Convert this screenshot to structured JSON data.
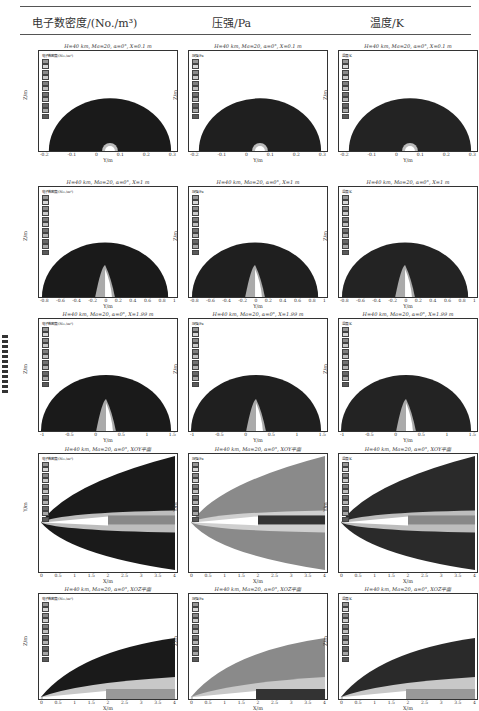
{
  "header": {
    "col1": "电子数密度/(No./m³)",
    "col2": "压强/Pa",
    "col3": "温度/K"
  },
  "rows": [
    {
      "section": "X=0.1 m",
      "titles": [
        "H=40 km, Ma=20, α=0°, X=0.1 m",
        "H=40 km, Ma=20, α=0°, X=0.1 m",
        "H=40 km, Ma=20, α=0°, X=0.1 m"
      ],
      "xlabel": "Y/m",
      "ylabel": "Z/m",
      "xticks": [
        "-0.2",
        "-0.1",
        "0",
        "0.1",
        "0.2",
        "0.3"
      ],
      "yticks": [
        "0.4",
        "0.2",
        "0"
      ]
    },
    {
      "section": "X=1 m",
      "titles": [
        "H=40 km, Ma=20, α=0°, X=1 m",
        "H=40 km, Ma=20, α=0°, X=1 m",
        "H=40 km, Ma=20, α=0°, X=1 m"
      ],
      "xlabel": "Y/m",
      "ylabel": "Z/m",
      "xticks": [
        "-0.8",
        "-0.6",
        "-0.4",
        "-0.2",
        "0",
        "0.2",
        "0.4",
        "0.6",
        "0.8",
        "1"
      ],
      "yticks": [
        "1.6",
        "1.4",
        "1.2",
        "1",
        "0.8",
        "0.6",
        "0.4",
        "0.2",
        "0"
      ]
    },
    {
      "section": "X=1.99 m",
      "titles": [
        "H=40 km, Ma=20, α=0°, X=1.99 m",
        "H=40 km, Ma=20, α=0°, X=1.99 m",
        "H=40 km, Ma=20, α=0°, X=1.99 m"
      ],
      "xlabel": "Y/m",
      "ylabel": "Z/m",
      "xticks": [
        "-1",
        "-0.5",
        "0",
        "0.5",
        "1",
        "1.5"
      ],
      "yticks": [
        "2.4",
        "2.2",
        "2",
        "1.8",
        "1.6",
        "1.4",
        "1.2",
        "1",
        "0.8",
        "0.6",
        "0.4",
        "0.2",
        "0"
      ]
    },
    {
      "section": "XOY平面",
      "titles": [
        "H=40 km, Ma=20, α=0°, XOY平面",
        "H=40 km, Ma=20, α=0°, XOY平面",
        "H=40 km, Ma=20, α=0°, XOY平面"
      ],
      "xlabel": "X/m",
      "ylabel": "Y/m",
      "xticks": [
        "0",
        "0.5",
        "1",
        "1.5",
        "2",
        "2.5",
        "3",
        "3.5",
        "4"
      ],
      "yticks": [
        "2",
        "1.5",
        "1",
        "0.5",
        "0",
        "-0.5",
        "-1",
        "-1.5"
      ]
    },
    {
      "section": "XOZ平面",
      "titles": [
        "H=40 km, Ma=20, α=0°, XOZ平面",
        "H=40 km, Ma=20, α=0°, XOZ平面",
        "H=40 km, Ma=20, α=0°, XOZ平面"
      ],
      "xlabel": "X/m",
      "ylabel": "Z/m",
      "xticks": [
        "0",
        "0.5",
        "1",
        "1.5",
        "2",
        "2.5",
        "3",
        "3.5",
        "4"
      ],
      "yticks": [
        "3.5",
        "3",
        "2.5",
        "2",
        "1.5",
        "1",
        "0.5",
        "0"
      ]
    }
  ],
  "legends": [
    "电子数密度/(No./m³)",
    "压强/Pa",
    "温度/K"
  ]
}
